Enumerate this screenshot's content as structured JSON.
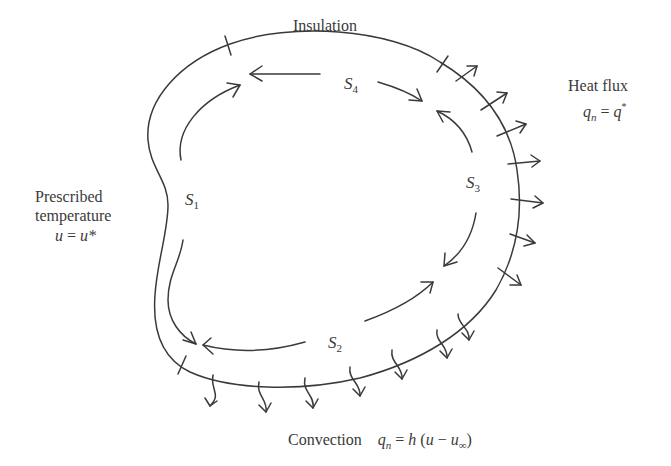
{
  "diagram": {
    "colors": {
      "stroke": "#3a3a3a",
      "text": "#3a3a3a",
      "background": "#ffffff"
    },
    "labels": {
      "insulation": "Insulation",
      "heat_flux": {
        "title": "Heat flux",
        "q": "q",
        "q_sub": "n",
        "eq": " = ",
        "rhs": "q",
        "rhs_sup": "*"
      },
      "prescribed": {
        "line1": "Prescribed",
        "line2": "temperature",
        "u": "u",
        "eq": " = ",
        "rhs": "u*"
      },
      "convection": {
        "title": "Convection",
        "q": "q",
        "q_sub": "n",
        "eq": " = ",
        "h": "h",
        "open": " (",
        "u": "u",
        "minus": " − ",
        "u_inf": "u",
        "u_inf_sub": "∞",
        "close": ")"
      }
    },
    "segments": [
      {
        "id": "S1",
        "letter": "S",
        "sub": "1"
      },
      {
        "id": "S2",
        "letter": "S",
        "sub": "2"
      },
      {
        "id": "S3",
        "letter": "S",
        "sub": "3"
      },
      {
        "id": "S4",
        "letter": "S",
        "sub": "4"
      }
    ],
    "boundary_conditions": [
      {
        "segment": "S1",
        "type": "Prescribed temperature"
      },
      {
        "segment": "S2",
        "type": "Convection"
      },
      {
        "segment": "S3",
        "type": "Heat flux"
      },
      {
        "segment": "S4",
        "type": "Insulation"
      }
    ]
  }
}
